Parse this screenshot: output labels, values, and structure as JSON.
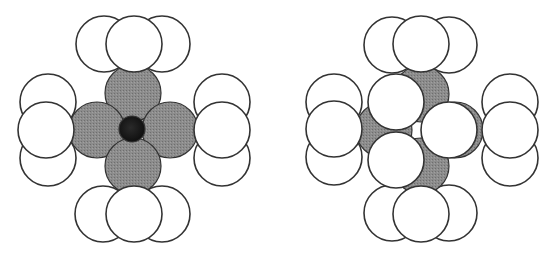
{
  "diagram": {
    "colors": {
      "white_atom": "#ffffff",
      "gray_atom": "#8a8a8a",
      "dark_atom": "#1a1a1a",
      "outline": "#333333"
    },
    "panels": [
      {
        "name": "left-model",
        "layers": [
          {
            "type": "white",
            "cx": 104,
            "cy": 44,
            "r": 28
          },
          {
            "type": "white",
            "cx": 162,
            "cy": 44,
            "r": 28
          },
          {
            "type": "white",
            "cx": 48,
            "cy": 102,
            "r": 28
          },
          {
            "type": "white",
            "cx": 48,
            "cy": 158,
            "r": 28
          },
          {
            "type": "white",
            "cx": 222,
            "cy": 102,
            "r": 28
          },
          {
            "type": "white",
            "cx": 222,
            "cy": 158,
            "r": 28
          },
          {
            "type": "white",
            "cx": 103,
            "cy": 214,
            "r": 28
          },
          {
            "type": "white",
            "cx": 162,
            "cy": 214,
            "r": 28
          },
          {
            "type": "gray",
            "cx": 133,
            "cy": 93,
            "r": 28
          },
          {
            "type": "gray",
            "cx": 97,
            "cy": 130,
            "r": 28
          },
          {
            "type": "gray",
            "cx": 170,
            "cy": 130,
            "r": 28
          },
          {
            "type": "gray",
            "cx": 133,
            "cy": 166,
            "r": 28
          },
          {
            "type": "dark",
            "cx": 132,
            "cy": 129,
            "r": 13
          },
          {
            "type": "white",
            "cx": 134,
            "cy": 44,
            "r": 28
          },
          {
            "type": "white",
            "cx": 46,
            "cy": 130,
            "r": 28
          },
          {
            "type": "white",
            "cx": 222,
            "cy": 130,
            "r": 28
          },
          {
            "type": "white",
            "cx": 134,
            "cy": 214,
            "r": 28
          }
        ]
      },
      {
        "name": "right-model",
        "layers": [
          {
            "type": "white",
            "cx": 392,
            "cy": 45,
            "r": 28
          },
          {
            "type": "white",
            "cx": 449,
            "cy": 45,
            "r": 28
          },
          {
            "type": "white",
            "cx": 334,
            "cy": 102,
            "r": 28
          },
          {
            "type": "white",
            "cx": 334,
            "cy": 157,
            "r": 28
          },
          {
            "type": "white",
            "cx": 510,
            "cy": 102,
            "r": 28
          },
          {
            "type": "white",
            "cx": 510,
            "cy": 158,
            "r": 28
          },
          {
            "type": "white",
            "cx": 392,
            "cy": 213,
            "r": 28
          },
          {
            "type": "white",
            "cx": 449,
            "cy": 213,
            "r": 28
          },
          {
            "type": "gray",
            "cx": 421,
            "cy": 94,
            "r": 28
          },
          {
            "type": "gray",
            "cx": 384,
            "cy": 130,
            "r": 28
          },
          {
            "type": "gray",
            "cx": 455,
            "cy": 130,
            "r": 28
          },
          {
            "type": "gray",
            "cx": 421,
            "cy": 166,
            "r": 28
          },
          {
            "type": "white",
            "cx": 421,
            "cy": 44,
            "r": 28
          },
          {
            "type": "white",
            "cx": 334,
            "cy": 129,
            "r": 28
          },
          {
            "type": "white",
            "cx": 510,
            "cy": 130,
            "r": 28
          },
          {
            "type": "white",
            "cx": 421,
            "cy": 214,
            "r": 28
          },
          {
            "type": "white",
            "cx": 396,
            "cy": 102,
            "r": 28
          },
          {
            "type": "white",
            "cx": 449,
            "cy": 130,
            "r": 28
          },
          {
            "type": "white",
            "cx": 396,
            "cy": 160,
            "r": 28
          }
        ]
      }
    ]
  }
}
